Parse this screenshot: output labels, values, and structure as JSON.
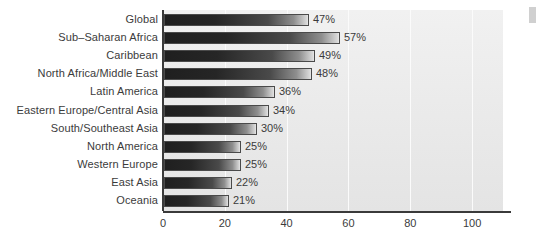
{
  "chart_data": {
    "type": "bar",
    "orientation": "horizontal",
    "title": "",
    "subtitle": "",
    "xlabel": "",
    "ylabel": "",
    "xlim": [
      0,
      110
    ],
    "ylim": null,
    "grid": true,
    "legend": null,
    "xticks": [
      {
        "value": 0,
        "label": "0"
      },
      {
        "value": 20,
        "label": "20"
      },
      {
        "value": 40,
        "label": "40"
      },
      {
        "value": 60,
        "label": "60"
      },
      {
        "value": 80,
        "label": "80"
      },
      {
        "value": 100,
        "label": "100"
      }
    ],
    "categories": [
      "Global",
      "Sub–Saharan Africa",
      "Caribbean",
      "North Africa/Middle East",
      "Latin America",
      "Eastern Europe/Central Asia",
      "South/Southeast Asia",
      "North America",
      "Western Europe",
      "East Asia",
      "Oceania"
    ],
    "values": [
      47,
      57,
      49,
      48,
      36,
      34,
      30,
      25,
      25,
      22,
      21
    ],
    "value_labels": [
      "47%",
      "57%",
      "49%",
      "48%",
      "36%",
      "34%",
      "30%",
      "25%",
      "25%",
      "22%",
      "21%"
    ],
    "colors": {
      "bar_gradient_start": "#1f1f1f",
      "bar_gradient_end": "#e8e8e8",
      "bar_border": "#4a4a4a",
      "plot_background": "#ebebeb",
      "gridline": "#fbfbfb",
      "axis": "#3a3a3a",
      "text": "#3b3b3b",
      "page_background": "#ffffff"
    }
  }
}
